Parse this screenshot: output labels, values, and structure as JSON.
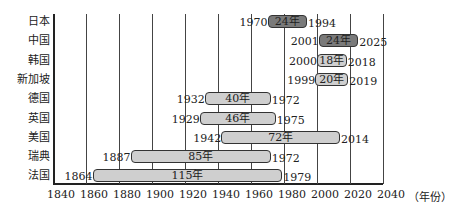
{
  "chart_data": {
    "type": "bar",
    "subtype": "horizontal-timeline",
    "title": "",
    "xlabel": "（年份）",
    "ylabel": "",
    "xlim": [
      1840,
      2040
    ],
    "xticks": [
      1840,
      1860,
      1880,
      1900,
      1920,
      1940,
      1960,
      1980,
      2000,
      2020,
      2040
    ],
    "grid": true,
    "categories": [
      "日本",
      "中国",
      "韩国",
      "新加坡",
      "德国",
      "英国",
      "美国",
      "瑞典",
      "法国"
    ],
    "series": [
      {
        "country": "日本",
        "start": 1970,
        "end": 1994,
        "duration_label": "24年",
        "shade": "dark"
      },
      {
        "country": "中国",
        "start": 2001,
        "end": 2025,
        "duration_label": "24年",
        "shade": "dark"
      },
      {
        "country": "韩国",
        "start": 2000,
        "end": 2018,
        "duration_label": "18年",
        "shade": "light"
      },
      {
        "country": "新加坡",
        "start": 1999,
        "end": 2019,
        "duration_label": "20年",
        "shade": "light"
      },
      {
        "country": "德国",
        "start": 1932,
        "end": 1972,
        "duration_label": "40年",
        "shade": "light"
      },
      {
        "country": "英国",
        "start": 1929,
        "end": 1975,
        "duration_label": "46年",
        "shade": "light"
      },
      {
        "country": "美国",
        "start": 1942,
        "end": 2014,
        "duration_label": "72年",
        "shade": "light"
      },
      {
        "country": "瑞典",
        "start": 1887,
        "end": 1972,
        "duration_label": "85年",
        "shade": "light"
      },
      {
        "country": "法国",
        "start": 1864,
        "end": 1979,
        "duration_label": "115年",
        "shade": "light"
      }
    ],
    "colors": {
      "dark": "#7a7a7a",
      "light": "#cfcfcf"
    }
  }
}
